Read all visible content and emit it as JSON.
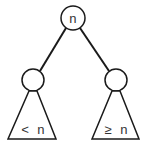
{
  "diagram": {
    "root": {
      "label": "n",
      "cx": 73,
      "cy": 18,
      "r": 12
    },
    "left_child": {
      "label": "",
      "cx": 33,
      "cy": 80,
      "r": 11
    },
    "right_child": {
      "label": "",
      "cx": 116,
      "cy": 80,
      "r": 11
    },
    "left_subtree": {
      "label": "< n",
      "apex": [
        33,
        91
      ],
      "base_left": [
        8,
        139
      ],
      "base_right": [
        56,
        139
      ]
    },
    "right_subtree": {
      "label": "≥ n",
      "apex": [
        116,
        91
      ],
      "base_left": [
        92,
        139
      ],
      "base_right": [
        139,
        139
      ]
    },
    "colors": {
      "stroke": "#1a1a1a",
      "text": "#333333",
      "background": "#ffffff"
    }
  }
}
